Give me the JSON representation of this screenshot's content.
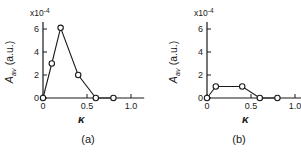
{
  "figure": {
    "background": "#ffffff",
    "ink_color": "#1a1a1a"
  },
  "chart_data": [
    {
      "type": "line",
      "caption": "(a)",
      "xlabel": "κ",
      "ylabel_var": "A",
      "ylabel_sub": "av",
      "ylabel_rest": " (a.u.)",
      "scale_prefix": "x10",
      "scale_exponent": "-4",
      "x": [
        0,
        0.1,
        0.2,
        0.4,
        0.6,
        0.8
      ],
      "y": [
        0,
        3,
        6.1,
        2,
        0,
        0
      ],
      "xlim": [
        0,
        1.15
      ],
      "ylim": [
        0,
        6.6
      ],
      "xticks": [
        0,
        0.5,
        1.0
      ],
      "xtick_labels": [
        "0",
        "0.5",
        "1.0"
      ],
      "yticks": [
        0,
        2,
        4,
        6
      ],
      "ytick_labels": [
        "0",
        "2",
        "4",
        "6"
      ],
      "marker": "circle-open",
      "grid": false,
      "legend": "none",
      "line_color": "#1a1a1a",
      "marker_fill": "#ffffff"
    },
    {
      "type": "line",
      "caption": "(b)",
      "xlabel": "κ",
      "ylabel_var": "A",
      "ylabel_sub": "av",
      "ylabel_rest": " (a.u.)",
      "scale_prefix": "x10",
      "scale_exponent": "-4",
      "x": [
        0,
        0.1,
        0.4,
        0.6,
        0.8
      ],
      "y": [
        0,
        1,
        1,
        0,
        0
      ],
      "xlim": [
        0,
        1.15
      ],
      "ylim": [
        0,
        6.6
      ],
      "xticks": [
        0,
        0.5,
        1.0
      ],
      "xtick_labels": [
        "0",
        "0.5",
        "1.0"
      ],
      "yticks": [
        0,
        2,
        4,
        6
      ],
      "ytick_labels": [
        "0",
        "2",
        "4",
        "6"
      ],
      "marker": "circle-open",
      "grid": false,
      "legend": "none",
      "line_color": "#1a1a1a",
      "marker_fill": "#ffffff"
    }
  ]
}
